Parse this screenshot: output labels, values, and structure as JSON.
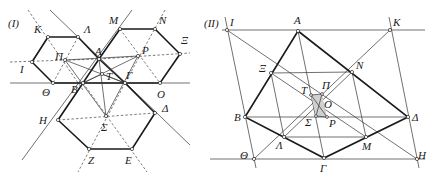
{
  "figures": [
    {
      "id": "I",
      "label": "(I)",
      "label_pos": [
        8,
        27
      ],
      "points": {
        "K": {
          "xy": [
            48,
            37
          ],
          "label": "Κ",
          "lx": 34,
          "ly": 33
        },
        "L": {
          "xy": [
            78,
            37
          ],
          "label": "Λ",
          "lx": 84,
          "ly": 33
        },
        "I": {
          "xy": [
            32,
            62
          ],
          "label": "Ι",
          "lx": 20,
          "ly": 73
        },
        "TH": {
          "xy": [
            53,
            83
          ],
          "label": "Θ",
          "lx": 42,
          "ly": 96
        },
        "PI": {
          "xy": [
            65,
            60
          ],
          "label": "Π",
          "lx": 55,
          "ly": 60
        },
        "A": {
          "xy": [
            99,
            59
          ],
          "label": "Α",
          "lx": 95,
          "ly": 55
        },
        "T": {
          "xy": [
            102,
            74
          ],
          "label": "Τ",
          "lx": 106,
          "ly": 80
        },
        "B": {
          "xy": [
            83,
            83
          ],
          "label": "Β",
          "lx": 71,
          "ly": 93
        },
        "G": {
          "xy": [
            125,
            83
          ],
          "label": "Γ",
          "lx": 126,
          "ly": 79
        },
        "M": {
          "xy": [
            120,
            29
          ],
          "label": "Μ",
          "lx": 109,
          "ly": 24
        },
        "N": {
          "xy": [
            155,
            29
          ],
          "label": "Ν",
          "lx": 159,
          "ly": 24
        },
        "XI": {
          "xy": [
            180,
            54
          ],
          "label": "Ξ",
          "lx": 181,
          "ly": 44
        },
        "P": {
          "xy": [
            138,
            56
          ],
          "label": "Ρ",
          "lx": 142,
          "ly": 54
        },
        "O": {
          "xy": [
            160,
            83
          ],
          "label": "Ο",
          "lx": 157,
          "ly": 98
        },
        "H": {
          "xy": [
            58,
            120
          ],
          "label": "Η",
          "lx": 39,
          "ly": 124
        },
        "S": {
          "xy": [
            106,
            116
          ],
          "label": "Σ",
          "lx": 101,
          "ly": 131
        },
        "D": {
          "xy": [
            155,
            113
          ],
          "label": "Δ",
          "lx": 162,
          "ly": 112
        },
        "Z": {
          "xy": [
            89,
            149
          ],
          "label": "Ζ",
          "lx": 88,
          "ly": 164
        },
        "E": {
          "xy": [
            132,
            149
          ],
          "label": "Ε",
          "lx": 125,
          "ly": 164
        }
      }
    },
    {
      "id": "II",
      "label": "(II)",
      "label_pos": [
        204,
        27
      ],
      "points": {
        "I": {
          "xy": [
            227,
            30
          ],
          "label": "Ι",
          "lx": 230,
          "ly": 26
        },
        "A": {
          "xy": [
            298,
            31
          ],
          "label": "Α",
          "lx": 294,
          "ly": 24
        },
        "K": {
          "xy": [
            390,
            30
          ],
          "label": "Κ",
          "lx": 393,
          "ly": 26
        },
        "XI": {
          "xy": [
            271,
            73
          ],
          "label": "Ξ",
          "lx": 259,
          "ly": 72
        },
        "N": {
          "xy": [
            352,
            72
          ],
          "label": "Ν",
          "lx": 356,
          "ly": 69
        },
        "T": {
          "xy": [
            311,
            95
          ],
          "label": "Τ",
          "lx": 301,
          "ly": 94
        },
        "PI": {
          "xy": [
            322,
            94
          ],
          "label": "Π",
          "lx": 322,
          "ly": 89
        },
        "O": {
          "xy": [
            319,
            102
          ],
          "label": "Ο",
          "lx": 324,
          "ly": 108
        },
        "B": {
          "xy": [
            245,
            117
          ],
          "label": "Β",
          "lx": 234,
          "ly": 121
        },
        "D": {
          "xy": [
            408,
            117
          ],
          "label": "Δ",
          "lx": 412,
          "ly": 121
        },
        "S": {
          "xy": [
            316,
            116
          ],
          "label": "Σ",
          "lx": 305,
          "ly": 126
        },
        "P": {
          "xy": [
            327,
            117
          ],
          "label": "Ρ",
          "lx": 329,
          "ly": 127
        },
        "L": {
          "xy": [
            284,
            137
          ],
          "label": "Λ",
          "lx": 276,
          "ly": 149
        },
        "M": {
          "xy": [
            366,
            137
          ],
          "label": "Μ",
          "lx": 362,
          "ly": 150
        },
        "TH": {
          "xy": [
            254,
            159
          ],
          "label": "Θ",
          "lx": 240,
          "ly": 159
        },
        "G": {
          "xy": [
            324,
            158
          ],
          "label": "Γ",
          "lx": 320,
          "ly": 172
        },
        "H": {
          "xy": [
            417,
            159
          ],
          "label": "Η",
          "lx": 418,
          "ly": 159
        }
      }
    }
  ]
}
